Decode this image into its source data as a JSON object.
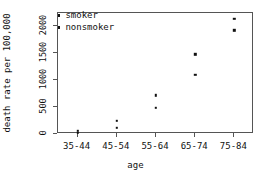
{
  "chart_data": {
    "type": "scatter",
    "title": "",
    "xlabel": "age",
    "ylabel": "death rate per 100,000",
    "categories": [
      "35-44",
      "45-54",
      "55-64",
      "65-74",
      "75-84"
    ],
    "yticks": [
      0,
      500,
      1000,
      1500,
      2000
    ],
    "ytick_labels": [
      "0",
      "500",
      "1000",
      "1500",
      "2000"
    ],
    "ylim": [
      0,
      2250
    ],
    "grid": false,
    "legend_position": "top-left",
    "series": [
      {
        "name": "smoker",
        "values": [
          60,
          250,
          720,
          1480,
          2140
        ]
      },
      {
        "name": "nonsmoker",
        "values": [
          20,
          110,
          490,
          1100,
          1930
        ]
      }
    ]
  },
  "legend": {
    "items": [
      {
        "label": "smoker"
      },
      {
        "label": "nonsmoker"
      }
    ]
  },
  "axes": {
    "x_title": "age",
    "y_title": "death rate per 100,000"
  }
}
